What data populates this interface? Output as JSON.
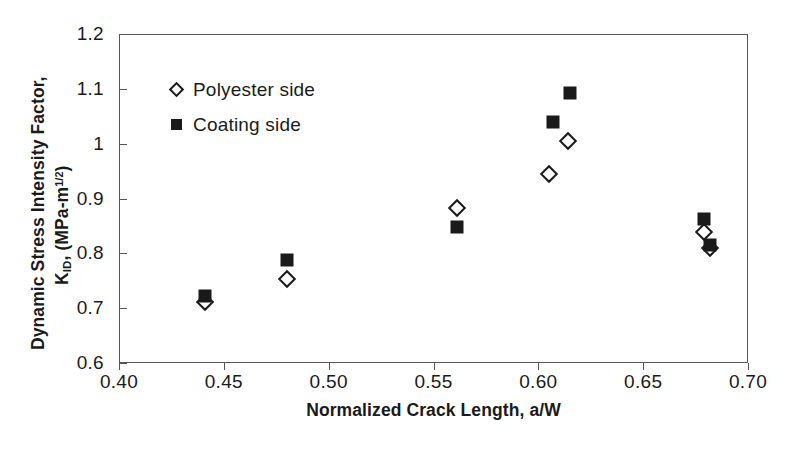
{
  "chart_data": {
    "type": "scatter",
    "title": "",
    "xlabel": "Normalized Crack Length, a/W",
    "ylabel_line1": "Dynamic Stress Intensity Factor,",
    "ylabel_line2_prefix": "K",
    "ylabel_line2_sub": "ID",
    "ylabel_line2_mid": ", (MPa-m",
    "ylabel_line2_sup": "1/2",
    "ylabel_line2_suffix": ")",
    "xlim": [
      0.4,
      0.7
    ],
    "ylim": [
      0.6,
      1.2
    ],
    "xticks": [
      0.4,
      0.45,
      0.5,
      0.55,
      0.6,
      0.65,
      0.7
    ],
    "xtick_labels": [
      "0.40",
      "0.45",
      "0.50",
      "0.55",
      "0.60",
      "0.65",
      "0.70"
    ],
    "yticks": [
      0.6,
      0.7,
      0.8,
      0.9,
      1.0,
      1.1,
      1.2
    ],
    "ytick_labels": [
      "0.6",
      "0.7",
      "0.8",
      "0.9",
      "1",
      "1.1",
      "1.2"
    ],
    "grid": false,
    "legend_position": "upper-left-inside",
    "series": [
      {
        "name": "Polyester side",
        "marker": "open-diamond",
        "color": "#1a1a1a",
        "points": [
          {
            "x": 0.441,
            "y": 0.712
          },
          {
            "x": 0.48,
            "y": 0.754
          },
          {
            "x": 0.561,
            "y": 0.882
          },
          {
            "x": 0.605,
            "y": 0.945
          },
          {
            "x": 0.614,
            "y": 1.005
          },
          {
            "x": 0.679,
            "y": 0.838
          },
          {
            "x": 0.682,
            "y": 0.81
          }
        ]
      },
      {
        "name": "Coating side",
        "marker": "filled-square",
        "color": "#1a1a1a",
        "points": [
          {
            "x": 0.441,
            "y": 0.723
          },
          {
            "x": 0.48,
            "y": 0.787
          },
          {
            "x": 0.561,
            "y": 0.848
          },
          {
            "x": 0.607,
            "y": 1.04
          },
          {
            "x": 0.615,
            "y": 1.093
          },
          {
            "x": 0.679,
            "y": 0.862
          },
          {
            "x": 0.682,
            "y": 0.815
          }
        ]
      }
    ]
  }
}
